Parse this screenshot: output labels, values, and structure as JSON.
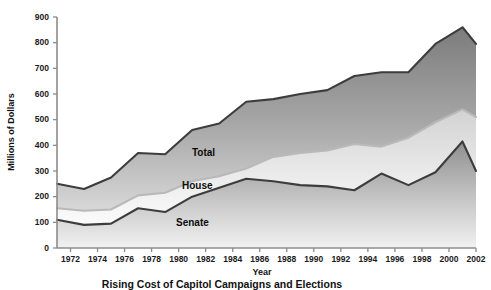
{
  "chart_data": {
    "type": "area",
    "stacked": true,
    "title": "",
    "caption": "Rising Cost of Capitol Campaigns and Elections",
    "xlabel": "Year",
    "ylabel": "Millions of Dollars",
    "ylim": [
      0,
      900
    ],
    "xlim": [
      1971,
      2002
    ],
    "grid": false,
    "legend_position": "inline-labels",
    "ytick_labels": [
      "0",
      "100",
      "200",
      "300",
      "400",
      "500",
      "600",
      "700",
      "800",
      "900"
    ],
    "ytick_values": [
      0,
      100,
      200,
      300,
      400,
      500,
      600,
      700,
      800,
      900
    ],
    "xtick_labels": [
      "1972",
      "1974",
      "1976",
      "1978",
      "1980",
      "1982",
      "1984",
      "1986",
      "1988",
      "1990",
      "1992",
      "1994",
      "1996",
      "1998",
      "2000",
      "2002"
    ],
    "xtick_values": [
      1972,
      1974,
      1976,
      1978,
      1980,
      1982,
      1984,
      1986,
      1988,
      1990,
      1992,
      1994,
      1996,
      1998,
      2000,
      2002
    ],
    "x": [
      1971,
      1973,
      1975,
      1977,
      1979,
      1981,
      1983,
      1985,
      1987,
      1989,
      1991,
      1993,
      1995,
      1997,
      1999,
      2001,
      2002
    ],
    "series": [
      {
        "name": "Senate",
        "label": "Senate",
        "color": "#9a9a9a",
        "edge_color": "#3d3d3d",
        "values": [
          110,
          90,
          95,
          155,
          140,
          200,
          235,
          270,
          260,
          245,
          240,
          225,
          290,
          245,
          295,
          415,
          300
        ]
      },
      {
        "name": "House",
        "label": "House",
        "color": "#e2e2e2",
        "edge_color": "#b4b4b4",
        "values": [
          45,
          55,
          55,
          50,
          75,
          60,
          45,
          40,
          95,
          125,
          140,
          180,
          105,
          185,
          195,
          125,
          210
        ]
      },
      {
        "name": "Total",
        "label": "Total",
        "color": "#8d8d8d",
        "edge_color": "#3d3d3d",
        "values": [
          95,
          85,
          125,
          165,
          150,
          200,
          205,
          260,
          225,
          230,
          235,
          265,
          290,
          255,
          305,
          320,
          285
        ]
      }
    ],
    "cumulative_totals": [
      250,
      230,
      275,
      370,
      365,
      460,
      485,
      570,
      580,
      600,
      615,
      670,
      685,
      685,
      795,
      860,
      795
    ]
  }
}
